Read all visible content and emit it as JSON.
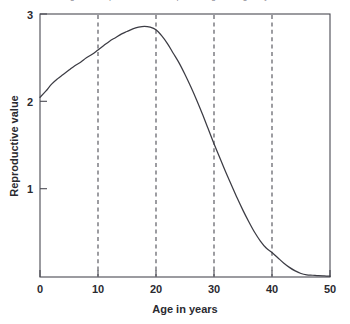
{
  "figure": {
    "background_color": "#ffffff",
    "curve_color": "#3c3c44",
    "axis_color": "#4a4a52",
    "guide_color": "#55555d",
    "caption_sliver": "Figure 1  Reproductive value plotted against age in years"
  },
  "chart_data": {
    "type": "line",
    "title": "",
    "subtitle": "",
    "xlabel": "Age in years",
    "ylabel": "Reproductive value",
    "xlim": [
      0,
      50
    ],
    "ylim": [
      0,
      3
    ],
    "xticks": [
      0,
      10,
      20,
      30,
      40,
      50
    ],
    "xticklabels": [
      "0",
      "10",
      "20",
      "30",
      "40",
      "50"
    ],
    "yticks": [
      1,
      2,
      3
    ],
    "yticklabels": [
      "1",
      "2",
      "3"
    ],
    "grid": false,
    "legend": null,
    "annotations": [],
    "vertical_guides": {
      "values": [
        10,
        20,
        30,
        40
      ],
      "style": "dashed",
      "color": "#55555d"
    },
    "series": [
      {
        "name": "Reproductive value",
        "color": "#3c3c44",
        "x": [
          0,
          1,
          2,
          3,
          4,
          5,
          6,
          7,
          8,
          9,
          10,
          11,
          12,
          13,
          14,
          15,
          16,
          17,
          18,
          19,
          20,
          21,
          22,
          23,
          24,
          25,
          26,
          27,
          28,
          29,
          30,
          31,
          32,
          33,
          34,
          35,
          36,
          37,
          38,
          39,
          40,
          41,
          42,
          43,
          44,
          45,
          46,
          47,
          48,
          49,
          50
        ],
        "y": [
          2.05,
          2.12,
          2.2,
          2.26,
          2.31,
          2.36,
          2.41,
          2.45,
          2.5,
          2.54,
          2.59,
          2.64,
          2.69,
          2.73,
          2.77,
          2.8,
          2.83,
          2.85,
          2.86,
          2.85,
          2.82,
          2.75,
          2.66,
          2.55,
          2.44,
          2.31,
          2.17,
          2.02,
          1.86,
          1.69,
          1.52,
          1.36,
          1.2,
          1.05,
          0.9,
          0.76,
          0.63,
          0.51,
          0.41,
          0.33,
          0.28,
          0.22,
          0.16,
          0.11,
          0.07,
          0.04,
          0.025,
          0.02,
          0.015,
          0.012,
          0.01
        ]
      }
    ]
  }
}
